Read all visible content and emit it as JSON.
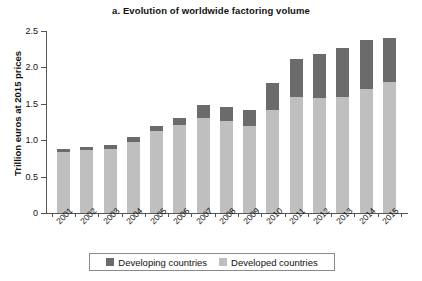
{
  "chart_data": {
    "type": "bar",
    "subtype": "stacked-vertical",
    "title": "a. Evolution of worldwide factoring volume",
    "xlabel": "",
    "ylabel": "Trillion euros at 2015 prices",
    "categories": [
      "2001",
      "2002",
      "2003",
      "2004",
      "2005",
      "2006",
      "2007",
      "2008",
      "2009",
      "2010",
      "2011",
      "2012",
      "2013",
      "2014",
      "2015"
    ],
    "series": [
      {
        "name": "Developed countries",
        "color": "#bfbfbf",
        "values": [
          0.84,
          0.87,
          0.88,
          0.98,
          1.13,
          1.21,
          1.3,
          1.27,
          1.2,
          1.42,
          1.6,
          1.58,
          1.59,
          1.7,
          1.8
        ]
      },
      {
        "name": "Developing countries",
        "color": "#6b6b6b",
        "values": [
          0.04,
          0.04,
          0.05,
          0.06,
          0.06,
          0.1,
          0.18,
          0.19,
          0.21,
          0.36,
          0.52,
          0.61,
          0.68,
          0.68,
          0.6
        ]
      }
    ],
    "totals": [
      0.88,
      0.91,
      0.93,
      1.04,
      1.19,
      1.31,
      1.48,
      1.46,
      1.41,
      1.78,
      2.12,
      2.19,
      2.27,
      2.38,
      2.4
    ],
    "ylim": [
      0,
      2.5
    ],
    "yticks": [
      0,
      0.5,
      1.0,
      1.5,
      2.0,
      2.5
    ],
    "ytick_labels": [
      "0",
      "0.5",
      "1.0",
      "1.5",
      "2.0",
      "2.5"
    ],
    "grid": false,
    "legend_position": "bottom",
    "stack_order": [
      "Developed countries",
      "Developing countries"
    ]
  },
  "legend": {
    "items": [
      {
        "label": "Developing countries",
        "swatch": "developing"
      },
      {
        "label": "Developed countries",
        "swatch": "developed"
      }
    ]
  }
}
